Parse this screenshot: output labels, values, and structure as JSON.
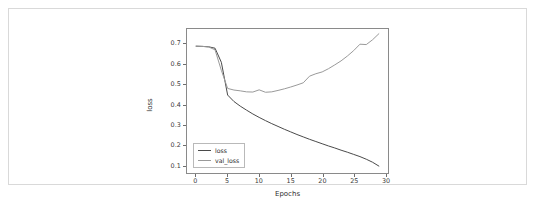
{
  "panel": {
    "border_color": "#d9d9d9",
    "background": "#ffffff"
  },
  "chart_data": {
    "type": "line",
    "title": "",
    "xlabel": "Epochs",
    "ylabel": "loss",
    "xlim": [
      -1.45,
      30.45
    ],
    "ylim": [
      0.0595,
      0.7755
    ],
    "grid": false,
    "legend_position": "lower left",
    "xticks": [
      0,
      5,
      10,
      15,
      20,
      25,
      30
    ],
    "xtick_labels": [
      "0",
      "5",
      "10",
      "15",
      "20",
      "25",
      "30"
    ],
    "yticks": [
      0.1,
      0.2,
      0.3,
      0.4,
      0.5,
      0.6,
      0.7
    ],
    "ytick_labels": [
      "0.1",
      "0.2",
      "0.3",
      "0.4",
      "0.5",
      "0.6",
      "0.7"
    ],
    "x": [
      0,
      1,
      2,
      3,
      4,
      5,
      6,
      7,
      8,
      9,
      10,
      11,
      12,
      13,
      14,
      15,
      16,
      17,
      18,
      19,
      20,
      21,
      22,
      23,
      24,
      25,
      26,
      27,
      28,
      29
    ],
    "series": [
      {
        "name": "loss",
        "color": "#4a4a4a",
        "linewidth": 1.0,
        "values": [
          0.69,
          0.689,
          0.687,
          0.68,
          0.61,
          0.447,
          0.415,
          0.392,
          0.372,
          0.353,
          0.336,
          0.32,
          0.305,
          0.291,
          0.277,
          0.264,
          0.251,
          0.239,
          0.227,
          0.216,
          0.205,
          0.194,
          0.184,
          0.173,
          0.163,
          0.152,
          0.141,
          0.128,
          0.113,
          0.094
        ]
      },
      {
        "name": "val_loss",
        "color": "#9a9a9a",
        "linewidth": 1.0,
        "values": [
          0.69,
          0.689,
          0.686,
          0.672,
          0.57,
          0.48,
          0.472,
          0.468,
          0.463,
          0.462,
          0.473,
          0.461,
          0.463,
          0.47,
          0.478,
          0.487,
          0.497,
          0.508,
          0.541,
          0.553,
          0.562,
          0.578,
          0.597,
          0.617,
          0.641,
          0.668,
          0.7,
          0.698,
          0.722,
          0.752
        ]
      }
    ],
    "legend_entries": [
      {
        "label": "loss",
        "color": "#4a4a4a"
      },
      {
        "label": "val_loss",
        "color": "#9a9a9a"
      }
    ]
  }
}
